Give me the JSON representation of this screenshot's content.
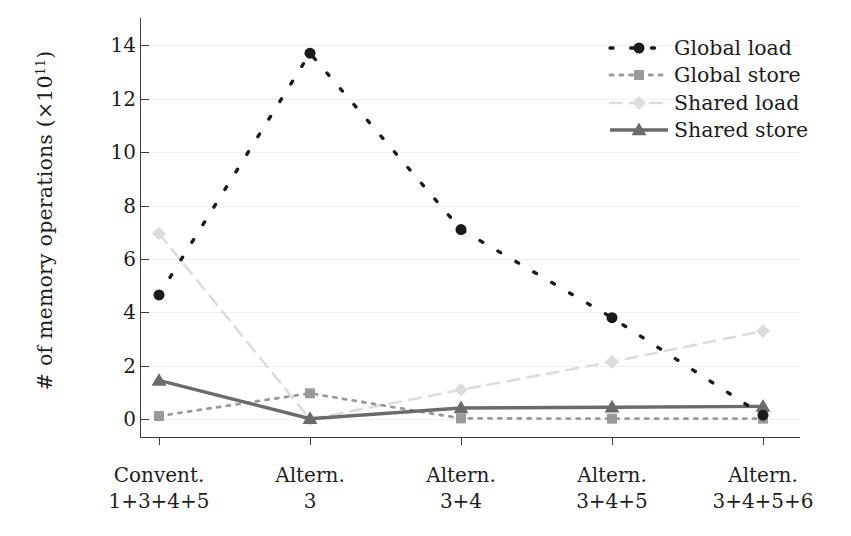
{
  "chart_data": {
    "type": "line",
    "title": "",
    "xlabel": "",
    "ylabel": "# of memory operations (×10¹¹)",
    "ylabel_prefix": "# of memory operations (×10",
    "ylabel_exponent": "11",
    "ylabel_suffix": ")",
    "ylim": [
      0,
      14.8
    ],
    "yticks": [
      0,
      2,
      4,
      6,
      8,
      10,
      12,
      14
    ],
    "ytick_labels": [
      "0",
      "2",
      "4",
      "6",
      "8",
      "10",
      "12",
      "14"
    ],
    "grid": true,
    "grid_color": "#f0f0f0",
    "legend_position": "top-right",
    "categories": [
      {
        "line1": "Convent.",
        "line2": "1+3+4+5"
      },
      {
        "line1": "Altern.",
        "line2": "3"
      },
      {
        "line1": "Altern.",
        "line2": "3+4"
      },
      {
        "line1": "Altern.",
        "line2": "3+4+5"
      },
      {
        "line1": "Altern.",
        "line2": "3+4+5+6"
      }
    ],
    "series": [
      {
        "name": "Global load",
        "marker": "circle",
        "linestyle": "dotted",
        "color": "#1a1a1a",
        "marker_size": 11,
        "values": [
          4.65,
          13.7,
          7.1,
          3.8,
          0.15
        ]
      },
      {
        "name": "Global store",
        "marker": "square",
        "linestyle": "fine-dotted",
        "color": "#9a9a9a",
        "marker_size": 10,
        "values": [
          0.12,
          0.97,
          0.03,
          0.02,
          0.02
        ]
      },
      {
        "name": "Shared load",
        "marker": "diamond",
        "linestyle": "dashed",
        "color": "#dcdcdc",
        "marker_size": 12,
        "values": [
          6.95,
          0.0,
          1.1,
          2.15,
          3.3
        ]
      },
      {
        "name": "Shared store",
        "marker": "triangle",
        "linestyle": "solid",
        "color": "#6b6b6b",
        "marker_size": 12,
        "values": [
          1.45,
          0.02,
          0.42,
          0.45,
          0.48
        ]
      }
    ]
  },
  "legend": {
    "items": [
      {
        "label": "Global load"
      },
      {
        "label": "Global store"
      },
      {
        "label": "Shared load"
      },
      {
        "label": "Shared store"
      }
    ]
  }
}
